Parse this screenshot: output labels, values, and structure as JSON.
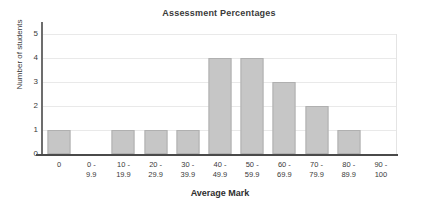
{
  "chart_data": {
    "type": "bar",
    "title": "Assessment Percentages",
    "xlabel": "Average Mark",
    "ylabel": "Number of students",
    "categories": [
      "0",
      "0 - 9.9",
      "10 - 19.9",
      "20 - 29.9",
      "30 - 39.9",
      "40 - 49.9",
      "50 - 59.9",
      "60 - 69.9",
      "70 - 79.9",
      "80 - 89.9",
      "90 - 100"
    ],
    "category_lines": [
      [
        "0",
        ""
      ],
      [
        "0 -",
        "9.9"
      ],
      [
        "10 -",
        "19.9"
      ],
      [
        "20 -",
        "29.9"
      ],
      [
        "30 -",
        "39.9"
      ],
      [
        "40 -",
        "49.9"
      ],
      [
        "50 -",
        "59.9"
      ],
      [
        "60 -",
        "69.9"
      ],
      [
        "70 -",
        "79.9"
      ],
      [
        "80 -",
        "89.9"
      ],
      [
        "90 -",
        "100"
      ]
    ],
    "values": [
      1,
      0,
      1,
      1,
      1,
      4,
      4,
      3,
      2,
      1,
      0
    ],
    "ylim": [
      0,
      5
    ],
    "yticks": [
      "5",
      "4",
      "3",
      "2",
      "1",
      "0"
    ],
    "grid": true,
    "legend": false,
    "bar_color": "#c6c6c6",
    "bar_border_color": "#b0b0b0",
    "grid_color": "#e9e9e9",
    "axis_color": "#4a4a4a"
  }
}
